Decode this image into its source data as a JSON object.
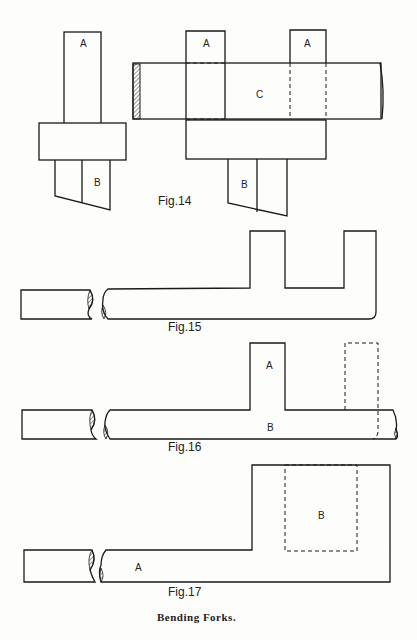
{
  "figures": {
    "fig14": {
      "caption": "Fig.14",
      "left_assembly": {
        "top_label": "A",
        "bottom_label": "B"
      },
      "right_assembly": {
        "top_left_label": "A",
        "top_right_label": "A",
        "bar_label": "C",
        "bottom_label": "B"
      }
    },
    "fig15": {
      "caption": "Fig.15"
    },
    "fig16": {
      "caption": "Fig.16",
      "upright_label": "A",
      "bar_label": "B"
    },
    "fig17": {
      "caption": "Fig.17",
      "bar_label": "A",
      "dashed_label": "B"
    }
  },
  "caption": "Bending Forks."
}
